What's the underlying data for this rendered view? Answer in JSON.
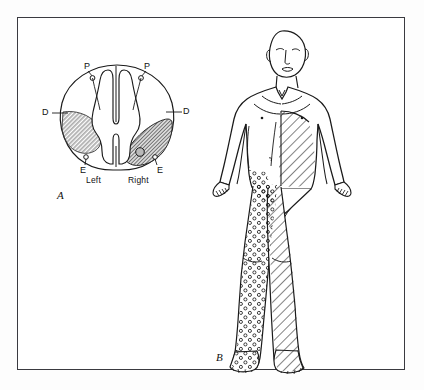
{
  "figure": {
    "background_color": "#ffffff",
    "page_color": "#fdfdfd",
    "border_color": "#3a3a40",
    "ink_color": "#111111",
    "hatch_color": "#3a3a3a",
    "stipple_color": "#222222"
  },
  "panel_a": {
    "caption": "A",
    "side_left_label": "Left",
    "side_right_label": "Right",
    "labels": {
      "p_left": "P",
      "p_right": "P",
      "d_left": "D",
      "d_right": "D",
      "e_left": "E",
      "e_right": "E"
    }
  },
  "panel_b": {
    "caption": "B"
  }
}
